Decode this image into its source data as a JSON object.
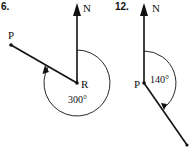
{
  "diagrams": [
    {
      "number": "6.",
      "north_label": "N",
      "start_label": "P",
      "center_label": "R",
      "angle_label": "300°",
      "bearing_degrees": 300
    },
    {
      "number": "12.",
      "north_label": "N",
      "center_label": "P",
      "angle_label": "140°",
      "bearing_degrees": 140
    }
  ],
  "colors": {
    "ink": "#111111",
    "background": "#ffffff"
  }
}
